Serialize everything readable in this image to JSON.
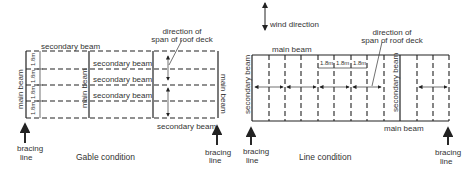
{
  "gable": {
    "caption": "Gable condition",
    "secondary_beam_top": "secondary beam",
    "secondary_beam_rows": [
      "secondary beam",
      "secondary beam",
      "secondary beam"
    ],
    "secondary_beam_bottom": "secondary beam",
    "main_beam_left": "main beam",
    "main_beam_middle": "main beam",
    "main_beam_right": "main beam",
    "dimensions": [
      "1.8m",
      "1.8m",
      "1.8m",
      "1.8m"
    ],
    "deck_direction_line1": "direction of",
    "deck_direction_line2": "span of roof deck",
    "bracing_left_line1": "bracing",
    "bracing_left_line2": "line",
    "bracing_right_line1": "bracing",
    "bracing_right_line2": "line"
  },
  "line": {
    "caption": "Line condition",
    "wind_direction": "wind direction",
    "main_beam_top": "main beam",
    "main_beam_bottom": "main beam",
    "secondary_beam_left": "secondary beam",
    "secondary_beam_middle": "secondary beam",
    "dimensions": [
      "1.8m",
      "1.8m",
      "1.8m"
    ],
    "deck_direction_line1": "direction of",
    "deck_direction_line2": "span of roof deck",
    "bracing_left_line1": "bracing",
    "bracing_left_line2": "line",
    "bracing_right_line1": "bracing",
    "bracing_right_line2": "line"
  }
}
